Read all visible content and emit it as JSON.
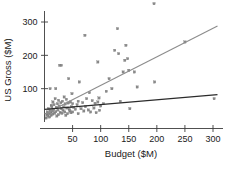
{
  "chart_data": {
    "type": "scatter",
    "title": "",
    "xlabel": "Budget ($M)",
    "ylabel": "US Gross ($M)",
    "xlim": [
      0,
      312
    ],
    "ylim": [
      0,
      400
    ],
    "xticks": [
      50,
      100,
      150,
      200,
      250,
      300
    ],
    "yticks": [
      100,
      200,
      300
    ],
    "grid": false,
    "legend": "none",
    "marker": "small-gray-square",
    "series": [
      {
        "name": "movies",
        "points": [
          [
            3,
            12
          ],
          [
            4,
            22
          ],
          [
            5,
            30
          ],
          [
            6,
            18
          ],
          [
            7,
            40
          ],
          [
            8,
            25
          ],
          [
            9,
            15
          ],
          [
            10,
            35
          ],
          [
            10,
            100
          ],
          [
            11,
            28
          ],
          [
            12,
            50
          ],
          [
            12,
            20
          ],
          [
            13,
            45
          ],
          [
            14,
            33
          ],
          [
            15,
            60
          ],
          [
            15,
            24
          ],
          [
            16,
            38
          ],
          [
            17,
            52
          ],
          [
            18,
            27
          ],
          [
            19,
            70
          ],
          [
            20,
            31
          ],
          [
            20,
            100
          ],
          [
            21,
            44
          ],
          [
            22,
            18
          ],
          [
            23,
            55
          ],
          [
            24,
            36
          ],
          [
            25,
            65
          ],
          [
            25,
            22
          ],
          [
            26,
            48
          ],
          [
            27,
            170
          ],
          [
            28,
            29
          ],
          [
            29,
            58
          ],
          [
            30,
            170
          ],
          [
            30,
            40
          ],
          [
            31,
            26
          ],
          [
            32,
            62
          ],
          [
            33,
            35
          ],
          [
            34,
            46
          ],
          [
            35,
            75
          ],
          [
            36,
            30
          ],
          [
            37,
            54
          ],
          [
            38,
            20
          ],
          [
            39,
            68
          ],
          [
            40,
            42
          ],
          [
            41,
            25
          ],
          [
            42,
            57
          ],
          [
            43,
            130
          ],
          [
            44,
            38
          ],
          [
            45,
            33
          ],
          [
            46,
            60
          ],
          [
            47,
            28
          ],
          [
            48,
            46
          ],
          [
            49,
            85
          ],
          [
            50,
            55
          ],
          [
            50,
            30
          ],
          [
            52,
            44
          ],
          [
            55,
            38
          ],
          [
            58,
            52
          ],
          [
            60,
            25
          ],
          [
            60,
            62
          ],
          [
            62,
            120
          ],
          [
            65,
            40
          ],
          [
            68,
            58
          ],
          [
            70,
            33
          ],
          [
            72,
            260
          ],
          [
            73,
            46
          ],
          [
            75,
            70
          ],
          [
            78,
            36
          ],
          [
            80,
            88
          ],
          [
            82,
            30
          ],
          [
            85,
            64
          ],
          [
            88,
            42
          ],
          [
            90,
            56
          ],
          [
            92,
            28
          ],
          [
            95,
            180
          ],
          [
            95,
            60
          ],
          [
            97,
            72
          ],
          [
            98,
            35
          ],
          [
            100,
            48
          ],
          [
            105,
            55
          ],
          [
            110,
            92
          ],
          [
            115,
            130
          ],
          [
            120,
            100
          ],
          [
            125,
            215
          ],
          [
            128,
            390
          ],
          [
            130,
            280
          ],
          [
            132,
            205
          ],
          [
            135,
            62
          ],
          [
            140,
            150
          ],
          [
            143,
            185
          ],
          [
            145,
            230
          ],
          [
            148,
            190
          ],
          [
            150,
            155
          ],
          [
            152,
            40
          ],
          [
            160,
            150
          ],
          [
            165,
            105
          ],
          [
            195,
            355
          ],
          [
            196,
            120
          ],
          [
            250,
            240
          ],
          [
            302,
            70
          ]
        ]
      }
    ],
    "fit_lines": [
      {
        "name": "upper-trend",
        "color": "#8c8c8c",
        "x0": 0,
        "y0": 24,
        "x1": 308,
        "y1": 288
      },
      {
        "name": "lower-trend",
        "color": "#2b2b2b",
        "x0": 0,
        "y0": 38,
        "x1": 308,
        "y1": 82
      }
    ]
  },
  "axes": {
    "x_title": "Budget ($M)",
    "y_title": "US Gross ($M)",
    "x_tick_labels": [
      "50",
      "100",
      "150",
      "200",
      "250",
      "300"
    ],
    "y_tick_labels": [
      "100",
      "200",
      "300"
    ]
  },
  "colors": {
    "point": "#8a8a8a",
    "upper_line": "#8c8c8c",
    "lower_line": "#2b2b2b",
    "axis": "#3c3c3c",
    "text": "#1a1a1a",
    "background": "#ffffff"
  }
}
